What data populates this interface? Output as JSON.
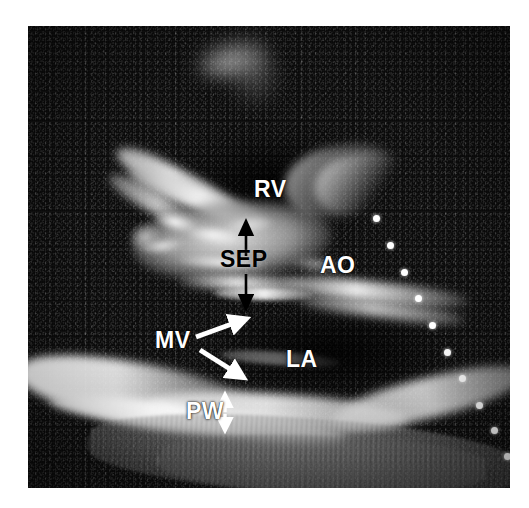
{
  "image": {
    "modality": "echocardiogram",
    "view": "parasternal long-axis",
    "frame": {
      "left": 28,
      "top": 26,
      "width": 482,
      "height": 462
    },
    "page_background": "#ffffff",
    "scan_background": "#0d0d0d"
  },
  "labels": [
    {
      "id": "rv",
      "text": "RV",
      "color": "#ffffff",
      "x": 226,
      "y": 152,
      "size": 23,
      "meaning": "right ventricle"
    },
    {
      "id": "sep",
      "text": "SEP",
      "color": "#000000",
      "x": 192,
      "y": 222,
      "size": 23,
      "meaning": "interventricular septum"
    },
    {
      "id": "ao",
      "text": "AO",
      "color": "#ffffff",
      "x": 292,
      "y": 228,
      "size": 23,
      "meaning": "aorta / aortic root"
    },
    {
      "id": "mv",
      "text": "MV",
      "color": "#ffffff",
      "x": 127,
      "y": 303,
      "size": 23,
      "meaning": "mitral valve"
    },
    {
      "id": "la",
      "text": "LA",
      "color": "#ffffff",
      "x": 258,
      "y": 322,
      "size": 23,
      "meaning": "left atrium"
    },
    {
      "id": "pw",
      "text": "PW",
      "color": "#ffffff",
      "x": 158,
      "y": 374,
      "size": 23,
      "meaning": "posterior wall"
    }
  ],
  "markers": {
    "sep_arrow_up": {
      "name": "septum-upper-arrow",
      "color": "#000000",
      "x": 218,
      "y1": 230,
      "y2": 200
    },
    "sep_arrow_down": {
      "name": "septum-lower-arrow",
      "color": "#000000",
      "x": 218,
      "y1": 248,
      "y2": 278
    },
    "mv_arrow_upper": {
      "name": "mitral-valve-upper-arrow",
      "color": "#ffffff",
      "x1": 168,
      "y1": 311,
      "x2": 219,
      "y2": 294
    },
    "mv_arrow_lower": {
      "name": "mitral-valve-lower-arrow",
      "color": "#ffffff",
      "x1": 172,
      "y1": 324,
      "x2": 217,
      "y2": 353
    },
    "pw_arrow": {
      "name": "posterior-wall-thickness-arrow",
      "color": "#ffffff",
      "x": 197,
      "y1": 372,
      "y2": 401
    }
  },
  "depth_scale": {
    "name": "depth-scale-markers",
    "color": "#ffffff",
    "dots": [
      {
        "x": 348,
        "y": 192
      },
      {
        "x": 362,
        "y": 219
      },
      {
        "x": 376,
        "y": 246
      },
      {
        "x": 390,
        "y": 272
      },
      {
        "x": 404,
        "y": 299
      },
      {
        "x": 419,
        "y": 326
      },
      {
        "x": 434,
        "y": 352
      },
      {
        "x": 451,
        "y": 379
      },
      {
        "x": 466,
        "y": 404
      },
      {
        "x": 479,
        "y": 430
      },
      {
        "x": 489,
        "y": 456
      }
    ]
  }
}
